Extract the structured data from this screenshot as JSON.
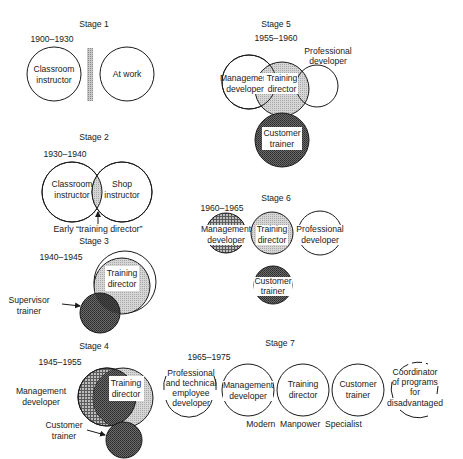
{
  "colors": {
    "ink": "#1a1a1a",
    "light_fill": "#cfcfcf",
    "dark_fill": "#4a4a4a",
    "background": "#ffffff"
  },
  "stage1": {
    "title": "Stage 1",
    "years": "1900–1930",
    "left_circle": [
      "Classroom",
      "instructor"
    ],
    "right_circle": [
      "At work"
    ]
  },
  "stage2": {
    "title": "Stage 2",
    "years": "1930–1940",
    "left_circle": [
      "Classroom",
      "instructor"
    ],
    "right_circle": [
      "Shop",
      "instructor"
    ],
    "overlap_label": "Early “training director”"
  },
  "stage3": {
    "title": "Stage 3",
    "years": "1940–1945",
    "main_circle": [
      "Training",
      "director"
    ],
    "side_label": [
      "Supervisor",
      "trainer"
    ]
  },
  "stage4": {
    "title": "Stage 4",
    "years": "1945–1955",
    "main_circle": [
      "Training",
      "director"
    ],
    "left_label": [
      "Management",
      "developer"
    ],
    "bottom_label": [
      "Customer",
      "trainer"
    ]
  },
  "stage5": {
    "title": "Stage 5",
    "years": "1955–1960",
    "left_circle": [
      "Management",
      "developer"
    ],
    "center_circle": [
      "Training",
      "director"
    ],
    "right_label": [
      "Professional",
      "developer"
    ],
    "bottom_circle": [
      "Customer",
      "trainer"
    ]
  },
  "stage6": {
    "title": "Stage 6",
    "years": "1960–1965",
    "left_circle": [
      "Management",
      "developer"
    ],
    "center_circle": [
      "Training",
      "director"
    ],
    "right_circle": [
      "Professional",
      "developer"
    ],
    "bottom_circle": [
      "Customer",
      "trainer"
    ]
  },
  "stage7": {
    "title": "Stage 7",
    "years": "1965–1975",
    "circles": [
      [
        "Professional",
        "and technical",
        "employee",
        "developer"
      ],
      [
        "Management",
        "developer"
      ],
      [
        "Training",
        "director"
      ],
      [
        "Customer",
        "trainer"
      ],
      [
        "Coordinator",
        "of programs",
        "for",
        "disadvantaged"
      ]
    ],
    "caption": "Modern  Manpower  Specialist"
  }
}
